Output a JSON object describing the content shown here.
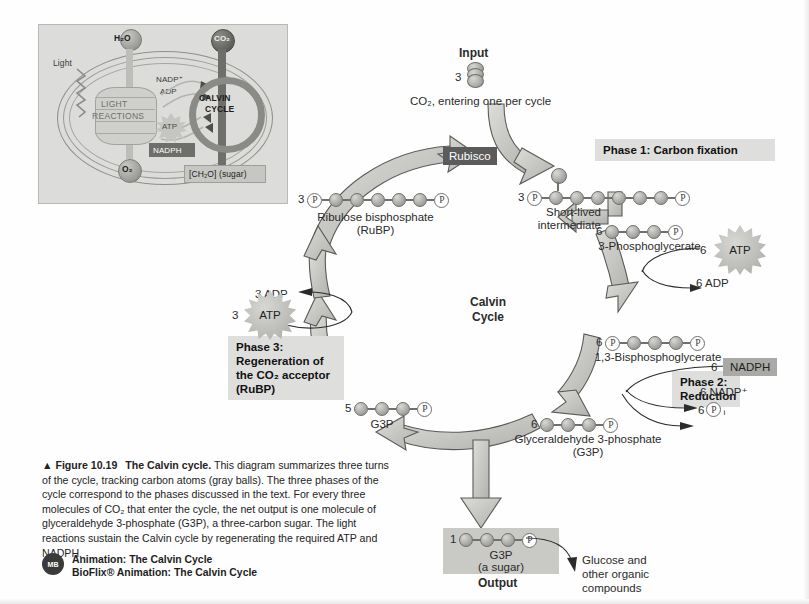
{
  "figure": {
    "number": "Figure 10.19",
    "title": "The Calvin cycle.",
    "caption": "This diagram summarizes three turns of the cycle, tracking carbon atoms (gray balls). The three phases of the cycle correspond to the phases discussed in the text. For every three molecules of CO₂ that enter the cycle, the net output is one molecule of glyceraldehyde 3-phosphate (G3P), a three-carbon sugar. The light reactions sustain the Calvin cycle by regenerating the required ATP and NADPH.",
    "arrow_marker": "▲"
  },
  "media": {
    "badge": "MB",
    "line1": "Animation: The Calvin Cycle",
    "line2": "BioFlix® Animation: The Calvin Cycle"
  },
  "inset": {
    "h2o": "H₂O",
    "co2": "CO₂",
    "light": "Light",
    "light_reactions": "LIGHT\nREACTIONS",
    "light_reactions_l1": "LIGHT",
    "light_reactions_l2": "REACTIONS",
    "nadp_plus": "NADP⁺",
    "adp": "ADP",
    "atp": "ATP",
    "nadph": "NADPH",
    "calvin_l1": "CALVIN",
    "calvin_l2": "CYCLE",
    "o2": "O₂",
    "sugar": "[CH₂O] (sugar)"
  },
  "main": {
    "input_label": "Input",
    "input_count": "3",
    "input_caption": "CO₂, entering one per cycle",
    "center_l1": "Calvin",
    "center_l2": "Cycle",
    "rubisco": "Rubisco",
    "phase1": "Phase 1: Carbon fixation",
    "phase2_l1": "Phase 2:",
    "phase2_l2": "Reduction",
    "phase3_l1": "Phase 3:",
    "phase3_l2": "Regeneration of",
    "phase3_l3": "the CO₂ acceptor",
    "phase3_l4": "(RuBP)",
    "p_glyph": "P",
    "output_label": "Output",
    "glucose_l1": "Glucose and",
    "glucose_l2": "other organic",
    "glucose_l3": "compounds"
  },
  "molecules": {
    "rubp": {
      "count": "3",
      "name_l1": "Ribulose bisphosphate",
      "name_l2": "(RuBP)",
      "carbons": 5,
      "phosphates": "both"
    },
    "intermediate": {
      "count": "3",
      "name_l1": "Short-lived",
      "name_l2": "intermediate",
      "carbons": 6,
      "phosphates": "both"
    },
    "pga": {
      "count": "6",
      "name_l1": "3-Phosphoglycerate",
      "carbons": 3,
      "phosphates": "right"
    },
    "bpg": {
      "count": "6",
      "name_l1": "1,3-Bisphosphoglycerate",
      "carbons": 3,
      "phosphates": "both"
    },
    "g3p_right": {
      "count": "6",
      "name_l1": "Glyceraldehyde 3-phosphate",
      "name_l2": "(G3P)",
      "carbons": 3,
      "phosphates": "right"
    },
    "g3p_left": {
      "count": "5",
      "name_l1": "G3P",
      "carbons": 3,
      "phosphates": "right"
    },
    "g3p_out": {
      "count": "1",
      "name_l1": "G3P",
      "name_l2": "(a sugar)",
      "carbons": 3,
      "phosphates": "right"
    }
  },
  "reactants": {
    "atp_phase2": {
      "count": "6",
      "label": "ATP"
    },
    "adp_phase2": {
      "text": "6 ADP"
    },
    "nadph_phase2": {
      "count": "6",
      "label": "NADPH"
    },
    "nadp_phase2": {
      "text": "6 NADP⁺"
    },
    "pi_phase2": {
      "count": "6",
      "glyph": "P",
      "sub": "i"
    },
    "atp_phase3": {
      "count": "3",
      "label": "ATP"
    },
    "adp_phase3": {
      "text": "3 ADP"
    }
  },
  "colors": {
    "rubisco_bg": "#5b5b5b",
    "phase_box_bg": "#dededc",
    "nadph_bg": "#a9a9a6",
    "arrow_fill": "#bcbcb9",
    "arrow_stroke": "#5a5a57",
    "ball": "#a8a8a4",
    "inset_bg": "#dcdcda"
  }
}
